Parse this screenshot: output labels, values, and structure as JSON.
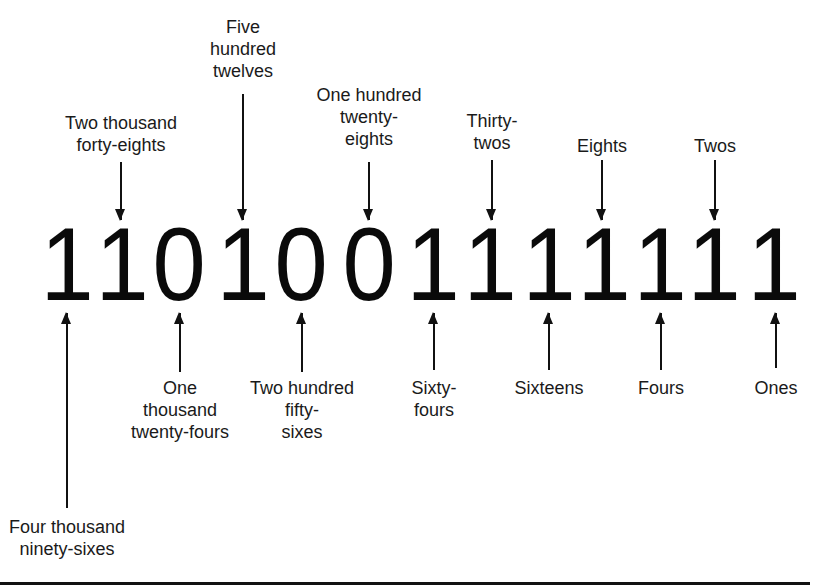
{
  "figure": {
    "binary_number": "1101001111111",
    "digits": [
      {
        "value": "1",
        "x": 67
      },
      {
        "value": "1",
        "x": 122
      },
      {
        "value": "0",
        "x": 179
      },
      {
        "value": "1",
        "x": 243
      },
      {
        "value": "0",
        "x": 301
      },
      {
        "value": "0",
        "x": 369
      },
      {
        "value": "1",
        "x": 433
      },
      {
        "value": "1",
        "x": 490
      },
      {
        "value": "1",
        "x": 549
      },
      {
        "value": "1",
        "x": 604
      },
      {
        "value": "1",
        "x": 660
      },
      {
        "value": "1",
        "x": 714
      },
      {
        "value": "1",
        "x": 774
      }
    ],
    "labels_above": [
      {
        "text": "Two thousand\nforty-eights",
        "x": 121,
        "text_top": 112,
        "arrow_top": 162,
        "arrow_bottom": 220
      },
      {
        "text": "Five\nhundred\ntwelves",
        "x": 243,
        "text_top": 16,
        "arrow_top": 94,
        "arrow_bottom": 220
      },
      {
        "text": "One hundred\ntwenty-\neights",
        "x": 369,
        "text_top": 84,
        "arrow_top": 162,
        "arrow_bottom": 220
      },
      {
        "text": "Thirty-\ntwos",
        "x": 492,
        "text_top": 110,
        "arrow_top": 160,
        "arrow_bottom": 220
      },
      {
        "text": "Eights",
        "x": 602,
        "text_top": 135,
        "arrow_top": 160,
        "arrow_bottom": 220
      },
      {
        "text": "Twos",
        "x": 715,
        "text_top": 135,
        "arrow_top": 160,
        "arrow_bottom": 220
      }
    ],
    "labels_below": [
      {
        "text": "Four thousand\nninety-sixes",
        "x": 67,
        "text_top": 516,
        "arrow_top": 313,
        "arrow_bottom": 508
      },
      {
        "text": "One\nthousand\ntwenty-fours",
        "x": 180,
        "text_top": 377,
        "arrow_top": 313,
        "arrow_bottom": 372
      },
      {
        "text": "Two hundred\nfifty-\nsixes",
        "x": 302,
        "text_top": 377,
        "arrow_top": 313,
        "arrow_bottom": 372
      },
      {
        "text": "Sixty-\nfours",
        "x": 434,
        "text_top": 377,
        "arrow_top": 313,
        "arrow_bottom": 370
      },
      {
        "text": "Sixteens",
        "x": 549,
        "text_top": 377,
        "arrow_top": 313,
        "arrow_bottom": 370
      },
      {
        "text": "Fours",
        "x": 661,
        "text_top": 377,
        "arrow_top": 313,
        "arrow_bottom": 370
      },
      {
        "text": "Ones",
        "x": 776,
        "text_top": 377,
        "arrow_top": 313,
        "arrow_bottom": 368
      }
    ]
  }
}
